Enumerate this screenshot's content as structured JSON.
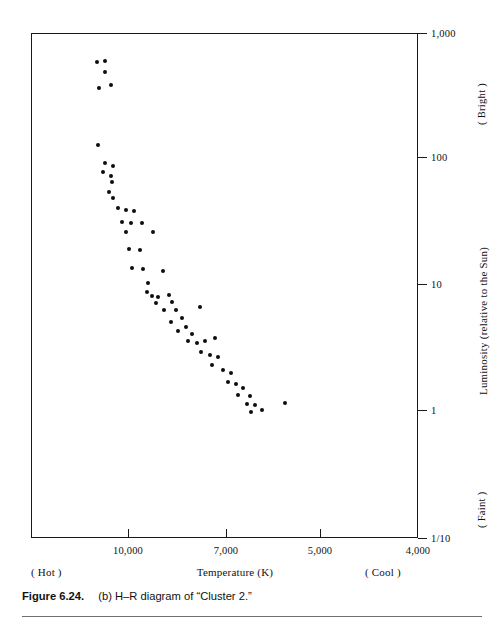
{
  "figure": {
    "number_label": "Figure 6.24.",
    "caption_text": "(b) H–R diagram of “Cluster 2.”"
  },
  "axes": {
    "x_title": "Temperature (K)",
    "x_left_note": "( Hot )",
    "x_right_note": "( Cool )",
    "y_title": "Luminosity (relative to the Sun)",
    "y_top_note": "( Bright )",
    "y_bottom_note": "( Faint )",
    "x_ticks": [
      {
        "label": "10,000",
        "value": 10000,
        "px": 128
      },
      {
        "label": "7,000",
        "value": 7000,
        "px": 226
      },
      {
        "label": "5,000",
        "value": 5000,
        "px": 320
      },
      {
        "label": "4,000",
        "value": 4000,
        "px": 418
      }
    ],
    "y_ticks": [
      {
        "label": "1,000",
        "value": 1000,
        "px": 33
      },
      {
        "label": "100",
        "value": 100,
        "px": 157
      },
      {
        "label": "10",
        "value": 10,
        "px": 284
      },
      {
        "label": "1",
        "value": 1,
        "px": 410
      },
      {
        "label": "1/10",
        "value": 0.1,
        "px": 538
      }
    ]
  },
  "chart_data": {
    "type": "scatter",
    "title": "(b) H–R diagram of “Cluster 2.”",
    "xlabel": "Temperature (K)",
    "ylabel": "Luminosity (relative to the Sun)",
    "x_scale": "linear-reversed",
    "y_scale": "log",
    "xlim": [
      11500,
      4000
    ],
    "ylim": [
      0.1,
      1000
    ],
    "grid": false,
    "legend": null,
    "marker": "filled-circle",
    "marker_color": "#0d0d0d",
    "series": [
      {
        "name": "Cluster 2 stars",
        "points": [
          {
            "px": 97,
            "py": 62,
            "temperature": 11550,
            "luminosity": 610
          },
          {
            "px": 105,
            "py": 61,
            "temperature": 11300,
            "luminosity": 625
          },
          {
            "px": 105,
            "py": 72,
            "temperature": 11300,
            "luminosity": 490
          },
          {
            "px": 111,
            "py": 85,
            "temperature": 11120,
            "luminosity": 375
          },
          {
            "px": 99,
            "py": 88,
            "temperature": 11490,
            "luminosity": 355
          },
          {
            "px": 98,
            "py": 145,
            "temperature": 11520,
            "luminosity": 130
          },
          {
            "px": 105,
            "py": 163,
            "temperature": 11300,
            "luminosity": 90
          },
          {
            "px": 113,
            "py": 166,
            "temperature": 11060,
            "luminosity": 85
          },
          {
            "px": 103,
            "py": 172,
            "temperature": 11370,
            "luminosity": 76
          },
          {
            "px": 111,
            "py": 176,
            "temperature": 11120,
            "luminosity": 70
          },
          {
            "px": 112,
            "py": 182,
            "temperature": 11090,
            "luminosity": 63
          },
          {
            "px": 109,
            "py": 192,
            "temperature": 11150,
            "luminosity": 53
          },
          {
            "px": 113,
            "py": 198,
            "temperature": 11030,
            "luminosity": 48
          },
          {
            "px": 118,
            "py": 208,
            "temperature": 10880,
            "luminosity": 40
          },
          {
            "px": 126,
            "py": 210,
            "temperature": 10640,
            "luminosity": 38
          },
          {
            "px": 134,
            "py": 211,
            "temperature": 10400,
            "luminosity": 37
          },
          {
            "px": 122,
            "py": 222,
            "temperature": 10760,
            "luminosity": 30
          },
          {
            "px": 131,
            "py": 223,
            "temperature": 10490,
            "luminosity": 29
          },
          {
            "px": 142,
            "py": 223,
            "temperature": 10160,
            "luminosity": 29
          },
          {
            "px": 126,
            "py": 232,
            "temperature": 10640,
            "luminosity": 25
          },
          {
            "px": 153,
            "py": 232,
            "temperature": 9830,
            "luminosity": 25
          },
          {
            "px": 129,
            "py": 249,
            "temperature": 10550,
            "luminosity": 18
          },
          {
            "px": 140,
            "py": 250,
            "temperature": 10220,
            "luminosity": 18
          },
          {
            "px": 132,
            "py": 268,
            "temperature": 10460,
            "luminosity": 13
          },
          {
            "px": 143,
            "py": 269,
            "temperature": 10130,
            "luminosity": 12
          },
          {
            "px": 163,
            "py": 271,
            "temperature": 9530,
            "luminosity": 12
          },
          {
            "px": 148,
            "py": 283,
            "temperature": 9980,
            "luminosity": 10
          },
          {
            "px": 147,
            "py": 292,
            "temperature": 10010,
            "luminosity": 8.7
          },
          {
            "px": 152,
            "py": 296,
            "temperature": 9860,
            "luminosity": 8.2
          },
          {
            "px": 158,
            "py": 297,
            "temperature": 9680,
            "luminosity": 8.1
          },
          {
            "px": 169,
            "py": 295,
            "temperature": 9350,
            "luminosity": 8.4
          },
          {
            "px": 156,
            "py": 303,
            "temperature": 9740,
            "luminosity": 7.3
          },
          {
            "px": 172,
            "py": 302,
            "temperature": 9260,
            "luminosity": 7.4
          },
          {
            "px": 164,
            "py": 310,
            "temperature": 9500,
            "luminosity": 6.6
          },
          {
            "px": 176,
            "py": 310,
            "temperature": 9140,
            "luminosity": 6.6
          },
          {
            "px": 200,
            "py": 307,
            "temperature": 8420,
            "luminosity": 6.9
          },
          {
            "px": 182,
            "py": 318,
            "temperature": 8960,
            "luminosity": 5.8
          },
          {
            "px": 171,
            "py": 322,
            "temperature": 9290,
            "luminosity": 5.4
          },
          {
            "px": 186,
            "py": 327,
            "temperature": 8840,
            "luminosity": 5.0
          },
          {
            "px": 178,
            "py": 331,
            "temperature": 9080,
            "luminosity": 4.7
          },
          {
            "px": 192,
            "py": 334,
            "temperature": 8660,
            "luminosity": 4.4
          },
          {
            "px": 188,
            "py": 341,
            "temperature": 8780,
            "luminosity": 3.9
          },
          {
            "px": 197,
            "py": 343,
            "temperature": 8510,
            "luminosity": 3.8
          },
          {
            "px": 205,
            "py": 341,
            "temperature": 8270,
            "luminosity": 3.9
          },
          {
            "px": 215,
            "py": 338,
            "temperature": 7970,
            "luminosity": 4.1
          },
          {
            "px": 201,
            "py": 352,
            "temperature": 8390,
            "luminosity": 3.2
          },
          {
            "px": 210,
            "py": 355,
            "temperature": 8120,
            "luminosity": 3.0
          },
          {
            "px": 218,
            "py": 357,
            "temperature": 7880,
            "luminosity": 2.9
          },
          {
            "px": 212,
            "py": 365,
            "temperature": 8060,
            "luminosity": 2.5
          },
          {
            "px": 223,
            "py": 370,
            "temperature": 7730,
            "luminosity": 2.3
          },
          {
            "px": 231,
            "py": 373,
            "temperature": 7490,
            "luminosity": 2.2
          },
          {
            "px": 228,
            "py": 382,
            "temperature": 7580,
            "luminosity": 1.8
          },
          {
            "px": 236,
            "py": 384,
            "temperature": 7340,
            "luminosity": 1.8
          },
          {
            "px": 243,
            "py": 388,
            "temperature": 7130,
            "luminosity": 1.6
          },
          {
            "px": 238,
            "py": 395,
            "temperature": 7280,
            "luminosity": 1.4
          },
          {
            "px": 250,
            "py": 396,
            "temperature": 6920,
            "luminosity": 1.4
          },
          {
            "px": 247,
            "py": 404,
            "temperature": 7010,
            "luminosity": 1.2
          },
          {
            "px": 255,
            "py": 405,
            "temperature": 6770,
            "luminosity": 1.15
          },
          {
            "px": 251,
            "py": 412,
            "temperature": 6890,
            "luminosity": 0.97
          },
          {
            "px": 262,
            "py": 410,
            "temperature": 6560,
            "luminosity": 1.0
          },
          {
            "px": 285,
            "py": 403,
            "temperature": 5870,
            "luminosity": 1.25
          }
        ]
      }
    ]
  }
}
